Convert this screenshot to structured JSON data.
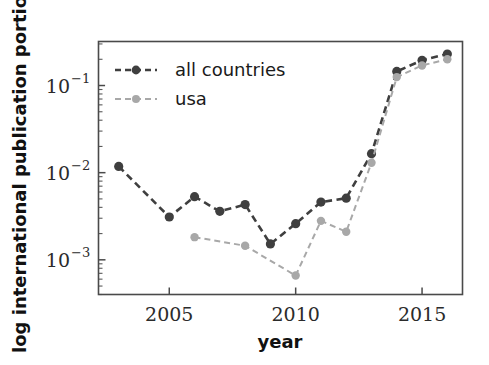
{
  "chart_data": {
    "type": "line",
    "title": "",
    "xlabel": "year",
    "ylabel": "log international publication portion",
    "yscale": "log",
    "xlim": [
      2002.2,
      2016.6
    ],
    "ylim": [
      0.0004,
      0.32
    ],
    "grid": false,
    "legend_position": "upper left",
    "x_ticks": [
      "2005",
      "2010",
      "2015"
    ],
    "x_tick_values": [
      2005,
      2010,
      2015
    ],
    "y_ticks": [
      "10⁻¹",
      "10⁻²",
      "10⁻³"
    ],
    "y_tick_values": [
      0.1,
      0.01,
      0.001
    ],
    "y_tick_mantissa": "10",
    "y_tick_exponents": [
      "-1",
      "-2",
      "-3"
    ],
    "series": [
      {
        "name": "all countries",
        "color": "#3f3f3f",
        "linestyle": "dashed",
        "marker": "circle",
        "x": [
          2003,
          2005,
          2006,
          2007,
          2008,
          2009,
          2010,
          2011,
          2012,
          2013,
          2014,
          2015,
          2016
        ],
        "values": [
          0.0118,
          0.0031,
          0.0053,
          0.0036,
          0.0043,
          0.00152,
          0.0026,
          0.0046,
          0.0051,
          0.0165,
          0.145,
          0.195,
          0.23
        ]
      },
      {
        "name": "usa",
        "color": "#a8a8a8",
        "linestyle": "dashed",
        "marker": "circle",
        "x": [
          2006,
          2008,
          2010,
          2011,
          2012,
          2013,
          2014,
          2015,
          2016
        ],
        "values": [
          0.00182,
          0.00145,
          0.00066,
          0.0028,
          0.0021,
          0.013,
          0.125,
          0.17,
          0.2
        ]
      }
    ]
  },
  "legend": {
    "entries": [
      {
        "label": "all countries"
      },
      {
        "label": "usa"
      }
    ]
  },
  "axes": {
    "x_title": "year",
    "y_title": "log international publication portion"
  },
  "colors": {
    "all_countries": "#3f3f3f",
    "usa": "#a8a8a8",
    "spine": "#4a4a4a",
    "text": "#111111",
    "background": "#ffffff"
  }
}
